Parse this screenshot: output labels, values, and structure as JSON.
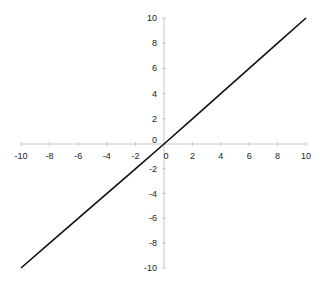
{
  "chart_data": {
    "type": "line",
    "title": "",
    "xlabel": "",
    "ylabel": "",
    "xlim": [
      -10,
      10
    ],
    "ylim": [
      -10,
      10
    ],
    "grid": false,
    "legend": null,
    "x_ticks": [
      -10,
      -8,
      -6,
      -4,
      -2,
      0,
      2,
      4,
      6,
      8,
      10
    ],
    "y_ticks": [
      -10,
      -8,
      -6,
      -4,
      -2,
      0,
      2,
      4,
      6,
      8,
      10
    ],
    "x_tick_labels": [
      "-10",
      "-8",
      "-6",
      "-4",
      "-2",
      "0",
      "2",
      "4",
      "6",
      "8",
      "10"
    ],
    "y_tick_labels": [
      "-10",
      "-8",
      "-6",
      "-4",
      "-2",
      "0",
      "2",
      "4",
      "6",
      "8",
      "10"
    ],
    "series": [
      {
        "name": "y = x",
        "x": [
          -10,
          -8,
          -6,
          -4,
          -2,
          0,
          2,
          4,
          6,
          8,
          10
        ],
        "y": [
          -10,
          -8,
          -6,
          -4,
          -2,
          0,
          2,
          4,
          6,
          8,
          10
        ],
        "color": "#111111"
      }
    ]
  },
  "colors": {
    "axis": "#c8c8c8",
    "line": "#111111",
    "label": "#222222"
  }
}
